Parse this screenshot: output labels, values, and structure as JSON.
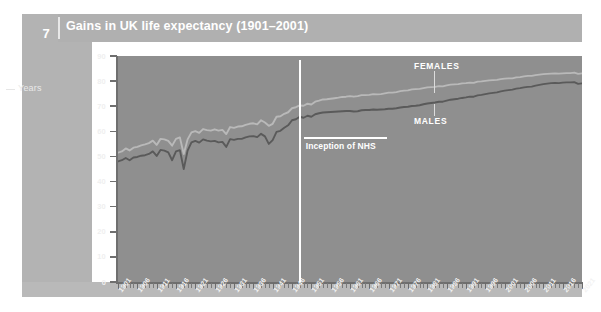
{
  "figure": {
    "number": "7"
  },
  "header": {
    "title": "Gains in UK life expectancy (1901–2001)"
  },
  "axis": {
    "y_title": "Years",
    "y_labels": [
      "90",
      "80",
      "70",
      "60",
      "50",
      "40",
      "30",
      "20",
      "10",
      "0"
    ]
  },
  "annotation": {
    "nhs_label": "Inception of NHS",
    "nhs_year": 1948
  },
  "series_labels": {
    "females": "FEMALES",
    "males": "MALES"
  },
  "colors": {
    "panel": "#b3b3b3",
    "title_bar": "#b0b0b0",
    "plot_bg": "#8f8f8f",
    "females_line": "#b9b9b9",
    "males_line": "#5a5a5a",
    "annotation": "#ffffff",
    "text": "#ffffff"
  },
  "chart_data": {
    "type": "line",
    "title": "Gains in UK life expectancy (1901–2001)",
    "xlabel": "",
    "ylabel": "Years",
    "ylim": [
      0,
      90
    ],
    "xlim": [
      1901,
      2021
    ],
    "grid": false,
    "legend": "inline-labels",
    "x": [
      1901,
      1902,
      1903,
      1904,
      1905,
      1906,
      1907,
      1908,
      1909,
      1910,
      1911,
      1912,
      1913,
      1914,
      1915,
      1916,
      1917,
      1918,
      1919,
      1920,
      1921,
      1922,
      1923,
      1924,
      1925,
      1926,
      1927,
      1928,
      1929,
      1930,
      1931,
      1932,
      1933,
      1934,
      1935,
      1936,
      1937,
      1938,
      1939,
      1940,
      1941,
      1942,
      1943,
      1944,
      1945,
      1946,
      1947,
      1948,
      1949,
      1950,
      1951,
      1952,
      1953,
      1954,
      1955,
      1956,
      1957,
      1958,
      1959,
      1960,
      1961,
      1962,
      1963,
      1964,
      1965,
      1966,
      1967,
      1968,
      1969,
      1970,
      1971,
      1972,
      1973,
      1974,
      1975,
      1976,
      1977,
      1978,
      1979,
      1980,
      1981,
      1982,
      1983,
      1984,
      1985,
      1986,
      1987,
      1988,
      1989,
      1990,
      1991,
      1992,
      1993,
      1994,
      1995,
      1996,
      1997,
      1998,
      1999,
      2000,
      2001,
      2002,
      2003,
      2004,
      2005,
      2006,
      2007,
      2008,
      2009,
      2010,
      2011,
      2012,
      2013,
      2014,
      2015,
      2016,
      2017,
      2018,
      2019,
      2020,
      2021
    ],
    "xticks": [
      1901,
      1906,
      1911,
      1916,
      1921,
      1926,
      1931,
      1936,
      1941,
      1946,
      1951,
      1956,
      1961,
      1966,
      1971,
      1976,
      1981,
      1986,
      1991,
      1996,
      2001,
      2006,
      2011,
      2016,
      2021
    ],
    "xticklabels": [
      "1901",
      "1906",
      "1911",
      "1916",
      "1921",
      "1926",
      "1931",
      "1936",
      "1941",
      "1946",
      "1951",
      "1956",
      "1961",
      "1966",
      "1971",
      "1976",
      "1981",
      "1986",
      "1991",
      "1996",
      "2001",
      "2006",
      "2011",
      "2016",
      "2021"
    ],
    "yticks": [
      0,
      10,
      20,
      30,
      40,
      50,
      60,
      70,
      80,
      90
    ],
    "annotations": [
      {
        "text": "Inception of NHS",
        "x": 1948,
        "type": "vertical-line"
      }
    ],
    "series": [
      {
        "name": "FEMALES",
        "color": "#b9b9b9",
        "values": [
          51.5,
          52.0,
          53.2,
          52.4,
          53.5,
          53.8,
          54.4,
          54.8,
          55.3,
          56.3,
          54.6,
          57.0,
          56.8,
          56.2,
          54.3,
          57.0,
          57.6,
          51.0,
          56.8,
          59.6,
          60.1,
          59.4,
          60.9,
          60.5,
          60.3,
          60.8,
          60.3,
          60.6,
          58.9,
          61.7,
          61.4,
          61.9,
          62.0,
          62.6,
          63.0,
          63.2,
          62.8,
          64.4,
          63.5,
          62.2,
          63.0,
          65.8,
          66.0,
          67.0,
          67.6,
          69.2,
          69.6,
          70.3,
          70.2,
          71.0,
          70.7,
          71.8,
          72.2,
          72.7,
          72.8,
          73.0,
          73.2,
          73.4,
          73.7,
          73.8,
          74.0,
          73.8,
          74.0,
          74.4,
          74.4,
          74.5,
          74.8,
          74.7,
          74.8,
          75.1,
          75.4,
          75.4,
          75.6,
          76.0,
          76.2,
          76.3,
          76.7,
          76.8,
          76.9,
          77.2,
          77.5,
          77.6,
          77.7,
          78.0,
          77.9,
          78.3,
          78.6,
          78.7,
          78.8,
          79.1,
          79.2,
          79.4,
          79.3,
          79.8,
          79.9,
          80.1,
          80.3,
          80.4,
          80.5,
          80.8,
          81.0,
          81.1,
          81.1,
          81.5,
          81.6,
          81.9,
          82.1,
          82.1,
          82.4,
          82.6,
          82.8,
          82.9,
          83.0,
          83.1,
          83.0,
          83.1,
          83.2,
          83.2,
          83.4,
          82.9,
          83.1
        ]
      },
      {
        "name": "MALES",
        "color": "#5a5a5a",
        "values": [
          48.0,
          48.5,
          49.4,
          48.5,
          49.6,
          49.8,
          50.3,
          50.5,
          51.0,
          52.0,
          50.2,
          52.6,
          52.3,
          51.6,
          48.5,
          52.0,
          52.5,
          45.0,
          52.3,
          55.6,
          56.2,
          55.5,
          56.8,
          56.3,
          56.0,
          56.2,
          55.6,
          55.8,
          53.8,
          56.9,
          56.6,
          57.0,
          57.0,
          57.6,
          58.0,
          58.1,
          57.7,
          59.0,
          58.0,
          55.0,
          56.5,
          59.8,
          60.2,
          61.4,
          62.4,
          64.4,
          64.8,
          65.8,
          65.4,
          66.2,
          65.8,
          66.8,
          67.2,
          67.5,
          67.6,
          67.7,
          67.8,
          67.9,
          68.0,
          68.1,
          68.1,
          67.9,
          68.0,
          68.4,
          68.5,
          68.5,
          68.7,
          68.6,
          68.7,
          68.8,
          69.0,
          69.0,
          69.2,
          69.5,
          69.7,
          69.8,
          70.1,
          70.2,
          70.4,
          70.8,
          71.1,
          71.3,
          71.5,
          71.8,
          71.8,
          72.2,
          72.6,
          72.8,
          73.0,
          73.3,
          73.5,
          73.8,
          73.8,
          74.3,
          74.5,
          74.8,
          75.1,
          75.3,
          75.5,
          75.9,
          76.2,
          76.4,
          76.6,
          77.0,
          77.2,
          77.5,
          77.7,
          77.8,
          78.2,
          78.5,
          78.8,
          79.0,
          79.2,
          79.3,
          79.2,
          79.4,
          79.5,
          79.5,
          79.6,
          78.9,
          79.1
        ]
      }
    ]
  }
}
